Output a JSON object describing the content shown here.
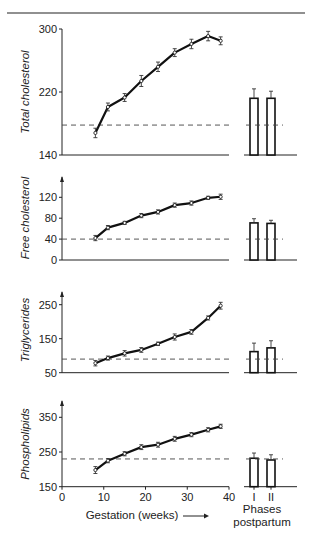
{
  "figure": {
    "xlabel": "Gestation (weeks)",
    "x_ticks": [
      "0",
      "10",
      "20",
      "30",
      "40"
    ],
    "postpartum_ticks": [
      "I",
      "II"
    ],
    "postpartum_label_line1": "Phases",
    "postpartum_label_line2": "postpartum"
  },
  "chart_data": [
    {
      "type": "line",
      "title": "",
      "ylabel": "Total cholesterol",
      "xlabel": "Gestation (weeks)",
      "xlim": [
        0,
        40
      ],
      "ylim": [
        140,
        300
      ],
      "y_ticks": [
        140,
        220,
        300
      ],
      "grid": false,
      "reference_level": 178,
      "series": [
        {
          "name": "Total cholesterol",
          "x": [
            8,
            11,
            15,
            19,
            23,
            27,
            31,
            35,
            38
          ],
          "values": [
            168,
            201,
            213,
            234,
            252,
            270,
            281,
            291,
            285
          ],
          "error": [
            6,
            5,
            5,
            7,
            6,
            5,
            6,
            6,
            5
          ]
        }
      ],
      "postpartum_bars": {
        "categories": [
          "I",
          "II"
        ],
        "values": [
          212,
          212
        ],
        "error": [
          12,
          9
        ]
      }
    },
    {
      "type": "line",
      "title": "",
      "ylabel": "Free cholesterol",
      "xlabel": "Gestation (weeks)",
      "xlim": [
        0,
        40
      ],
      "ylim": [
        0,
        160
      ],
      "y_ticks": [
        0,
        40,
        80,
        120
      ],
      "grid": false,
      "reference_level": 40,
      "series": [
        {
          "name": "Free cholesterol",
          "x": [
            8,
            11,
            15,
            19,
            23,
            27,
            31,
            35,
            38
          ],
          "values": [
            42,
            62,
            71,
            85,
            92,
            105,
            109,
            119,
            121
          ],
          "error": [
            5,
            4,
            3,
            4,
            4,
            4,
            4,
            3,
            5
          ]
        }
      ],
      "postpartum_bars": {
        "categories": [
          "I",
          "II"
        ],
        "values": [
          71,
          70
        ],
        "error": [
          8,
          6
        ]
      }
    },
    {
      "type": "line",
      "title": "",
      "ylabel": "Triglycerides",
      "xlabel": "Gestation (weeks)",
      "xlim": [
        0,
        40
      ],
      "ylim": [
        50,
        280
      ],
      "y_ticks": [
        50,
        150,
        250
      ],
      "grid": false,
      "reference_level": 90,
      "series": [
        {
          "name": "Triglycerides",
          "x": [
            8,
            11,
            15,
            19,
            23,
            27,
            31,
            35,
            38
          ],
          "values": [
            78,
            93,
            107,
            117,
            135,
            155,
            170,
            211,
            247
          ],
          "error": [
            8,
            6,
            8,
            7,
            5,
            9,
            7,
            6,
            10
          ]
        }
      ],
      "postpartum_bars": {
        "categories": [
          "I",
          "II"
        ],
        "values": [
          112,
          123
        ],
        "error": [
          25,
          21
        ]
      }
    },
    {
      "type": "line",
      "title": "",
      "ylabel": "Phospholipids",
      "xlabel": "Gestation (weeks)",
      "xlim": [
        0,
        40
      ],
      "ylim": [
        150,
        390
      ],
      "y_ticks": [
        150,
        250,
        350
      ],
      "grid": false,
      "reference_level": 230,
      "series": [
        {
          "name": "Phospholipids",
          "x": [
            8,
            11,
            15,
            19,
            23,
            27,
            31,
            35,
            38
          ],
          "values": [
            198,
            225,
            245,
            264,
            271,
            288,
            300,
            314,
            324
          ],
          "error": [
            10,
            6,
            6,
            7,
            7,
            7,
            6,
            6,
            6
          ]
        }
      ],
      "postpartum_bars": {
        "categories": [
          "I",
          "II"
        ],
        "values": [
          232,
          227
        ],
        "error": [
          15,
          15
        ]
      }
    }
  ]
}
